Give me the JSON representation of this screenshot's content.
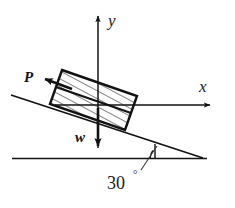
{
  "figure": {
    "background_color": "#ffffff",
    "stroke_color": "#121212",
    "axes": {
      "x_label": "x",
      "y_label": "y",
      "origin_label": ""
    },
    "vectors": [
      {
        "name": "applied-force",
        "label": "P",
        "direction": "up-the-incline-left"
      },
      {
        "name": "weight-force",
        "label": "w",
        "direction": "down"
      }
    ],
    "incline": {
      "angle_label": "30",
      "degree_symbol": "°",
      "angle_value": 30,
      "angle_units": "degrees"
    },
    "block": {
      "name": "hatched-block",
      "fill": "hatched",
      "rows": 2
    }
  }
}
